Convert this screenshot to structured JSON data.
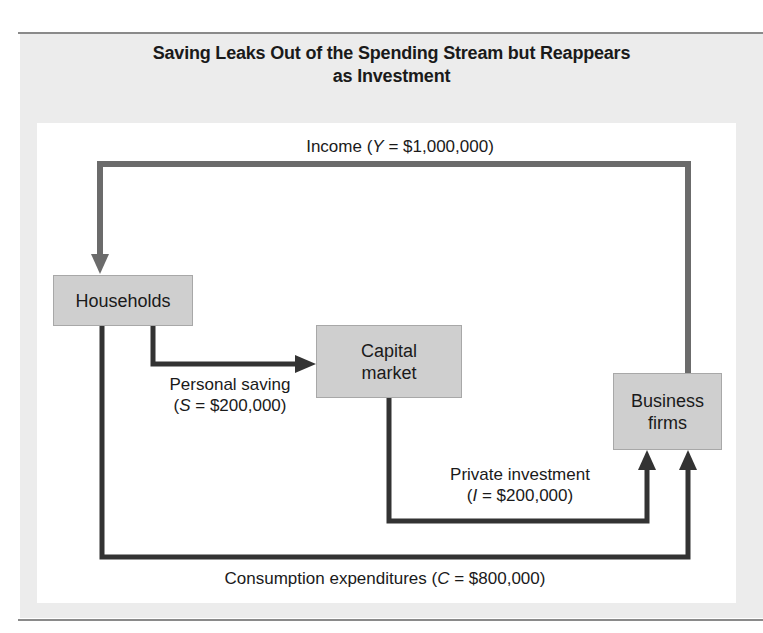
{
  "figure": {
    "title_line1": "Saving Leaks Out of the Spending Stream but Reappears",
    "title_line2": "as Investment"
  },
  "nodes": {
    "households": {
      "label": "Households"
    },
    "capital_market": {
      "line1": "Capital",
      "line2": "market"
    },
    "business_firms": {
      "line1": "Business",
      "line2": "firms"
    }
  },
  "flows": {
    "income": {
      "name": "Income",
      "symbol": "Y",
      "value": "$1,000,000",
      "prefix": "Income (",
      "suffix": " = $1,000,000)",
      "from": "Business firms",
      "to": "Households",
      "color": "#6b6b6b"
    },
    "saving": {
      "line1": "Personal saving",
      "symbol": "S",
      "prefix": "(",
      "suffix": " = $200,000)",
      "value": "$200,000",
      "from": "Households",
      "to": "Capital market",
      "color": "#333333"
    },
    "investment": {
      "line1": "Private investment",
      "symbol": "I",
      "prefix": "(",
      "suffix": " = $200,000)",
      "value": "$200,000",
      "from": "Capital market",
      "to": "Business firms",
      "color": "#333333"
    },
    "consumption": {
      "name": "Consumption expenditures",
      "symbol": "C",
      "prefix": "Consumption expenditures (",
      "suffix": " = $800,000)",
      "value": "$800,000",
      "from": "Households",
      "to": "Business firms",
      "color": "#333333"
    }
  },
  "colors": {
    "box_fill": "#cfcfcf",
    "panel_bg": "#ececec",
    "income_arrow": "#6b6b6b",
    "dark_arrow": "#333333"
  }
}
